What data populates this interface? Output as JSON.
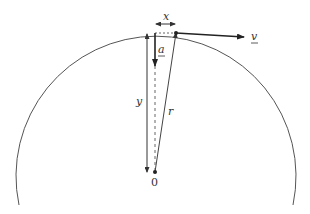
{
  "diagram": {
    "labels": {
      "x": "x",
      "a": "a",
      "v": "v",
      "y": "y",
      "r": "r",
      "center": "0"
    },
    "colors": {
      "stroke": "#444444",
      "arrow": "#222222",
      "text": "#333333",
      "background": "#ffffff"
    }
  }
}
